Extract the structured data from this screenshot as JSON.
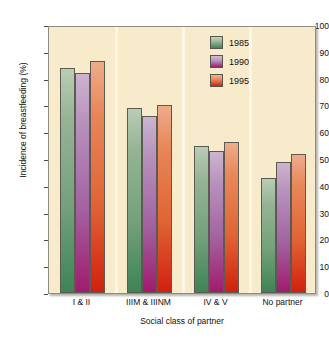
{
  "figure": {
    "clipped_caption_remnant": "Figure 3  Incidence of breastfeeding by social class of partner"
  },
  "axes": {
    "ylabel": "Incidence of breastfeeding (%)",
    "xlabel": "Social class of partner",
    "yticks": [
      "0",
      "10",
      "20",
      "30",
      "40",
      "50",
      "60",
      "70",
      "80",
      "90",
      "100"
    ]
  },
  "legend": {
    "items": [
      {
        "label": "1985",
        "color": "#74a07c"
      },
      {
        "label": "1990",
        "color": "#a2629f"
      },
      {
        "label": "1995",
        "color": "#e06434"
      }
    ]
  },
  "chart_data": {
    "type": "bar",
    "title": "",
    "xlabel": "Social class of partner",
    "ylabel": "Incidence of breastfeeding (%)",
    "ylim": [
      0,
      100
    ],
    "ytick_step": 10,
    "grid": false,
    "legend_position": "top-right",
    "categories": [
      "I & II",
      "IIIM & IIINM",
      "IV & V",
      "No partner"
    ],
    "series": [
      {
        "name": "1985",
        "color": "#74a07c",
        "values": [
          84,
          69,
          55,
          43
        ]
      },
      {
        "name": "1990",
        "color": "#a2629f",
        "values": [
          82,
          66,
          53,
          49
        ]
      },
      {
        "name": "1995",
        "color": "#e06434",
        "values": [
          86.5,
          70,
          56.5,
          52
        ]
      }
    ]
  }
}
